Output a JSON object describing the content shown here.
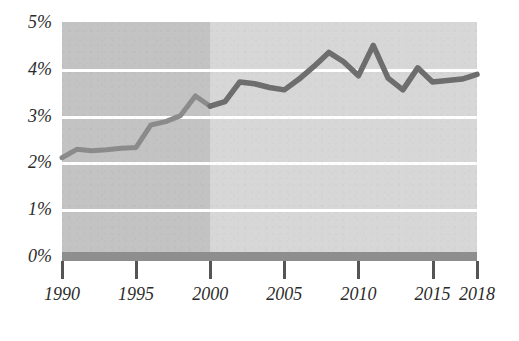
{
  "chart_data": {
    "type": "line",
    "title": "",
    "subtitle": "",
    "xlabel": "",
    "ylabel": "",
    "xlim": [
      1990,
      2018
    ],
    "ylim": [
      0,
      5
    ],
    "grid": true,
    "legend": "none",
    "y_tick_labels": [
      "5%",
      "4%",
      "3%",
      "2%",
      "1%",
      "0%"
    ],
    "y_tick_values": [
      5,
      4,
      3,
      2,
      1,
      0
    ],
    "x_tick_labels": [
      "1990",
      "1995",
      "2000",
      "2005",
      "2010",
      "2015",
      "2018"
    ],
    "x_tick_values": [
      1990,
      1995,
      2000,
      2005,
      2010,
      2015,
      2018
    ],
    "series": [
      {
        "name": "value",
        "x": [
          1990,
          1991,
          1992,
          1993,
          1994,
          1995,
          1996,
          1997,
          1998,
          1999,
          2000,
          2001,
          2002,
          2003,
          2004,
          2005,
          2006,
          2007,
          2008,
          2009,
          2010,
          2011,
          2012,
          2013,
          2014,
          2015,
          2016,
          2017,
          2018
        ],
        "values": [
          2.1,
          2.28,
          2.25,
          2.27,
          2.3,
          2.32,
          2.8,
          2.87,
          3.0,
          3.42,
          3.2,
          3.3,
          3.72,
          3.68,
          3.6,
          3.55,
          3.78,
          4.05,
          4.35,
          4.15,
          3.85,
          4.5,
          3.8,
          3.55,
          4.02,
          3.72,
          3.75,
          3.78,
          3.88
        ]
      }
    ],
    "shaded_regions": [
      {
        "name": "early-period",
        "from": 1990,
        "to": 2000,
        "color": "#c3c3c3"
      },
      {
        "name": "late-period",
        "from": 2000,
        "to": 2018,
        "color": "#d7d7d7"
      }
    ],
    "colors": {
      "line_early": "#8b8b8b",
      "line_late": "#6e6e6e",
      "gridline": "#ffffff",
      "baseline_bar": "#8e8e8e",
      "axis": "#555555",
      "text": "#2b2b2b"
    }
  }
}
